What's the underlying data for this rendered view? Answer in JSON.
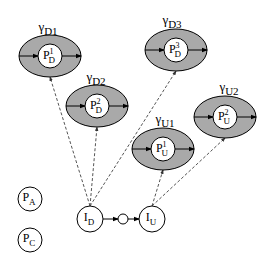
{
  "colors": {
    "ring_fill": "#a9a9a9",
    "stroke": "#000000",
    "inner_fill": "#ffffff",
    "dashed": "#555555"
  },
  "regions": [
    {
      "id": "D1",
      "gamma_label": "γ",
      "gamma_sub": "D1",
      "inner_main": "P",
      "inner_sub": "D",
      "inner_sup": "1"
    },
    {
      "id": "D2",
      "gamma_label": "γ",
      "gamma_sub": "D2",
      "inner_main": "P",
      "inner_sub": "D",
      "inner_sup": "2"
    },
    {
      "id": "D3",
      "gamma_label": "γ",
      "gamma_sub": "D3",
      "inner_main": "P",
      "inner_sub": "D",
      "inner_sup": "3"
    },
    {
      "id": "U1",
      "gamma_label": "γ",
      "gamma_sub": "U1",
      "inner_main": "P",
      "inner_sub": "U",
      "inner_sup": "1"
    },
    {
      "id": "U2",
      "gamma_label": "γ",
      "gamma_sub": "U2",
      "inner_main": "P",
      "inner_sub": "U",
      "inner_sup": "2"
    }
  ],
  "nodes": [
    {
      "id": "PA",
      "main": "P",
      "sub": "A"
    },
    {
      "id": "PC",
      "main": "P",
      "sub": "C"
    },
    {
      "id": "ID",
      "main": "I",
      "sub": "D"
    },
    {
      "id": "IU",
      "main": "I",
      "sub": "U"
    }
  ],
  "edges": [
    {
      "from": "ID",
      "to": "D1",
      "style": "dashed"
    },
    {
      "from": "ID",
      "to": "D2",
      "style": "dashed"
    },
    {
      "from": "ID",
      "to": "D3",
      "style": "dashed"
    },
    {
      "from": "IU",
      "to": "U1",
      "style": "dashed"
    },
    {
      "from": "IU",
      "to": "U2",
      "style": "dashed"
    },
    {
      "from": "ID",
      "to": "junction",
      "style": "solid"
    },
    {
      "from": "junction",
      "to": "IU",
      "style": "solid"
    }
  ]
}
